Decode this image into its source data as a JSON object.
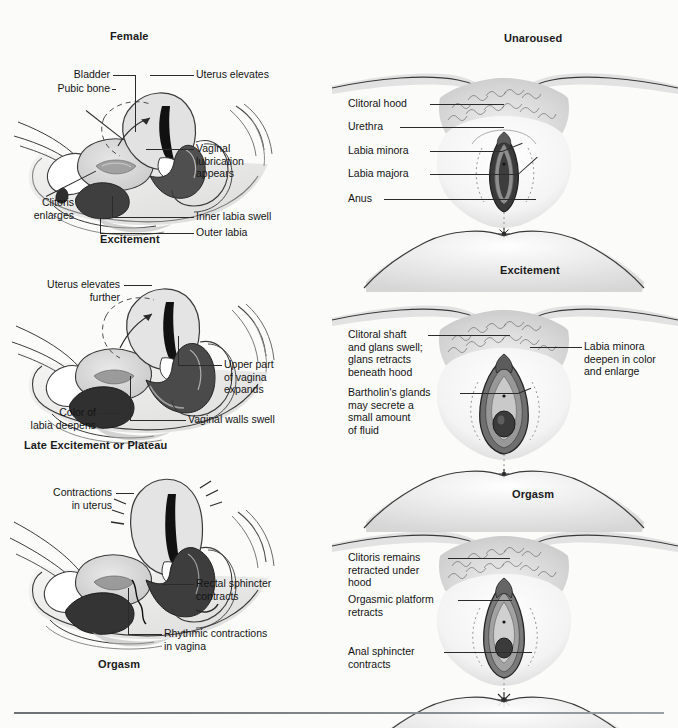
{
  "figure": {
    "title_left_column": "Female",
    "background_color": "#fbfbfa",
    "line_color": "#2b2b2b"
  },
  "panels": [
    {
      "id": "sagittal-excitement",
      "view": "sagittal",
      "heading": "Female",
      "caption": "Excitement",
      "labels": [
        {
          "name": "bladder",
          "text": "Bladder"
        },
        {
          "name": "pubic-bone",
          "text": "Pubic bone"
        },
        {
          "name": "uterus-elevates",
          "text": "Uterus elevates"
        },
        {
          "name": "vaginal-lubrication",
          "text": "Vaginal\nlubrication\nappears"
        },
        {
          "name": "clitoris-enlarges",
          "text": "Clitoris\nenlarges"
        },
        {
          "name": "inner-labia-swell",
          "text": "Inner labia swell"
        },
        {
          "name": "outer-labia",
          "text": "Outer labia"
        }
      ]
    },
    {
      "id": "sagittal-plateau",
      "view": "sagittal",
      "heading": "",
      "caption": "Late Excitement or Plateau",
      "labels": [
        {
          "name": "uterus-elevates-further",
          "text": "Uterus elevates\nfurther"
        },
        {
          "name": "upper-part-of-vagina-expands",
          "text": "Upper part\nof vagina\nexpands"
        },
        {
          "name": "color-of-labia-deepens",
          "text": "Color of\nlabia deepens"
        },
        {
          "name": "vaginal-walls-swell",
          "text": "Vaginal walls swell"
        }
      ]
    },
    {
      "id": "sagittal-orgasm",
      "view": "sagittal",
      "heading": "",
      "caption": "Orgasm",
      "labels": [
        {
          "name": "contractions-in-uterus",
          "text": "Contractions\nin uterus"
        },
        {
          "name": "rectal-sphincter-contracts",
          "text": "Rectal sphincter\ncontracts"
        },
        {
          "name": "rhythmic-contractions-in-vagina",
          "text": "Rhythmic contractions\nin vagina"
        }
      ]
    },
    {
      "id": "external-unaroused",
      "view": "external",
      "heading": "Unaroused",
      "caption": "",
      "labels": [
        {
          "name": "clitoral-hood",
          "text": "Clitoral hood"
        },
        {
          "name": "urethra",
          "text": "Urethra"
        },
        {
          "name": "labia-minora",
          "text": "Labia minora"
        },
        {
          "name": "labia-majora",
          "text": "Labia majora"
        },
        {
          "name": "anus",
          "text": "Anus"
        }
      ]
    },
    {
      "id": "external-excitement",
      "view": "external",
      "heading": "Excitement",
      "caption": "",
      "labels": [
        {
          "name": "clitoral-shaft-and-glans",
          "text": "Clitoral shaft\nand glans swell;\nglans retracts\nbeneath hood"
        },
        {
          "name": "bartholins-glands",
          "text": "Bartholin's glands\nmay secrete a\nsmall amount\nof fluid"
        },
        {
          "name": "labia-minora-deepen",
          "text": "Labia minora\ndeepen in color\nand enlarge"
        }
      ]
    },
    {
      "id": "external-orgasm",
      "view": "external",
      "heading": "Orgasm",
      "caption": "",
      "labels": [
        {
          "name": "clitoris-remains-retracted",
          "text": "Clitoris remains\nretracted under\nhood"
        },
        {
          "name": "orgasmic-platform-retracts",
          "text": "Orgasmic platform\nretracts"
        },
        {
          "name": "anal-sphincter-contracts",
          "text": "Anal sphincter\ncontracts"
        }
      ]
    }
  ]
}
